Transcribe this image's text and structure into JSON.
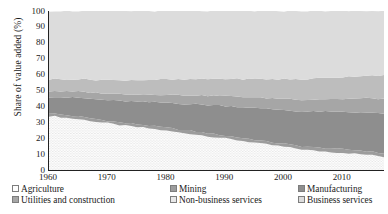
{
  "chart_data": {
    "type": "area",
    "title": "",
    "xlabel": "",
    "ylabel": "Share of value added (%)",
    "xlim": [
      1960,
      2017
    ],
    "ylim": [
      0,
      100
    ],
    "grid": false,
    "stacked": true,
    "legend_position": "bottom",
    "y_ticks": [
      0,
      10,
      20,
      30,
      40,
      50,
      60,
      70,
      80,
      90,
      100
    ],
    "x_ticks": [
      1960,
      1970,
      1980,
      1990,
      2000,
      2010
    ],
    "x": [
      1960,
      1961,
      1962,
      1963,
      1964,
      1965,
      1966,
      1967,
      1968,
      1969,
      1970,
      1971,
      1972,
      1973,
      1974,
      1975,
      1976,
      1977,
      1978,
      1979,
      1980,
      1981,
      1982,
      1983,
      1984,
      1985,
      1986,
      1987,
      1988,
      1989,
      1990,
      1991,
      1992,
      1993,
      1994,
      1995,
      1996,
      1997,
      1998,
      1999,
      2000,
      2001,
      2002,
      2003,
      2004,
      2005,
      2006,
      2007,
      2008,
      2009,
      2010,
      2011,
      2012,
      2013,
      2014,
      2015,
      2016,
      2017
    ],
    "series": [
      {
        "name": "Agriculture",
        "fill": "#fdfdfd",
        "pattern": "dots",
        "pattern_color": "#8a8a8a",
        "values": [
          34.0,
          33.7,
          33.3,
          32.8,
          32.4,
          32.0,
          31.5,
          31.0,
          30.4,
          29.9,
          29.4,
          28.8,
          28.3,
          27.8,
          27.4,
          27.0,
          26.6,
          26.1,
          25.6,
          25.1,
          24.6,
          24.1,
          23.6,
          23.2,
          22.8,
          22.3,
          21.8,
          21.3,
          20.8,
          20.3,
          19.8,
          19.3,
          18.8,
          18.3,
          17.8,
          17.2,
          16.6,
          16.1,
          15.6,
          15.1,
          14.6,
          14.0,
          13.5,
          13.0,
          12.6,
          12.2,
          11.9,
          11.6,
          11.3,
          11.1,
          10.8,
          10.5,
          10.2,
          9.9,
          9.6,
          9.2,
          8.8,
          8.3
        ]
      },
      {
        "name": "Mining",
        "fill": "#9c9c9c",
        "pattern": "solid",
        "values": [
          1.6,
          1.6,
          1.6,
          1.6,
          1.6,
          1.6,
          1.6,
          1.6,
          1.6,
          1.6,
          1.6,
          1.6,
          1.6,
          1.7,
          1.8,
          1.8,
          1.8,
          1.8,
          1.8,
          1.9,
          2.0,
          2.0,
          2.0,
          1.9,
          1.9,
          1.9,
          1.8,
          1.8,
          1.8,
          1.8,
          1.8,
          1.8,
          1.8,
          1.8,
          1.8,
          1.8,
          1.8,
          1.8,
          1.8,
          1.8,
          1.9,
          1.9,
          1.9,
          1.9,
          2.0,
          2.0,
          2.1,
          2.1,
          2.2,
          2.1,
          2.2,
          2.3,
          2.3,
          2.3,
          2.3,
          2.2,
          2.1,
          2.1
        ]
      },
      {
        "name": "Manufacturing",
        "fill": "#8e8e8e",
        "pattern": "solid",
        "values": [
          10.5,
          10.8,
          11.0,
          11.2,
          11.5,
          11.8,
          12.0,
          12.2,
          12.5,
          12.7,
          13.0,
          13.2,
          13.5,
          13.8,
          14.0,
          14.2,
          14.5,
          14.8,
          15.2,
          15.5,
          15.8,
          16.0,
          16.2,
          16.5,
          16.8,
          17.2,
          17.5,
          17.8,
          18.2,
          18.5,
          18.8,
          19.0,
          19.3,
          19.5,
          19.8,
          20.0,
          20.3,
          20.6,
          20.8,
          21.0,
          21.3,
          21.5,
          21.8,
          22.0,
          22.2,
          22.5,
          22.8,
          23.0,
          23.2,
          23.3,
          23.5,
          23.6,
          23.8,
          24.0,
          24.2,
          24.4,
          24.6,
          24.8
        ]
      },
      {
        "name": "Utilities and construction",
        "fill": "#a6a6a6",
        "pattern": "solid",
        "values": [
          3.5,
          3.6,
          3.6,
          3.7,
          3.8,
          3.9,
          4.0,
          4.0,
          4.1,
          4.2,
          4.3,
          4.3,
          4.4,
          4.5,
          4.6,
          4.6,
          4.7,
          4.8,
          4.9,
          5.0,
          5.1,
          5.2,
          5.3,
          5.4,
          5.5,
          5.6,
          5.7,
          5.8,
          5.9,
          6.0,
          6.1,
          6.2,
          6.3,
          6.4,
          6.5,
          6.6,
          6.7,
          6.8,
          6.9,
          7.0,
          7.1,
          7.2,
          7.3,
          7.4,
          7.5,
          7.6,
          7.8,
          7.9,
          8.0,
          8.1,
          8.2,
          8.4,
          8.6,
          8.8,
          9.0,
          9.2,
          9.4,
          9.6
        ]
      },
      {
        "name": "Non-business services",
        "fill": "#bdbdbd",
        "pattern": "solid",
        "values": [
          7.4,
          7.5,
          7.6,
          7.7,
          7.8,
          7.9,
          8.0,
          8.1,
          8.2,
          8.3,
          8.4,
          8.5,
          8.6,
          8.7,
          8.8,
          9.0,
          9.1,
          9.2,
          9.3,
          9.4,
          9.5,
          9.6,
          9.8,
          9.9,
          10.0,
          10.2,
          10.3,
          10.4,
          10.6,
          10.7,
          10.8,
          11.0,
          11.1,
          11.2,
          11.4,
          11.5,
          11.7,
          11.8,
          12.0,
          12.1,
          12.3,
          12.4,
          12.6,
          12.7,
          12.9,
          13.0,
          13.2,
          13.3,
          13.5,
          13.6,
          13.8,
          13.9,
          14.1,
          14.2,
          14.4,
          14.5,
          14.7,
          14.8
        ]
      },
      {
        "name": "Business services",
        "fill": "#dcdcdc",
        "pattern": "solid",
        "values": [
          43.0,
          42.8,
          42.9,
          43.0,
          42.9,
          42.8,
          42.9,
          43.1,
          43.2,
          43.3,
          43.3,
          43.6,
          43.6,
          43.5,
          43.4,
          43.4,
          43.3,
          43.3,
          43.2,
          43.1,
          43.0,
          43.1,
          43.1,
          43.1,
          43.0,
          42.8,
          42.9,
          42.9,
          42.7,
          42.7,
          42.7,
          42.7,
          42.7,
          42.8,
          42.7,
          42.9,
          42.9,
          42.9,
          42.9,
          43.0,
          42.8,
          43.0,
          42.9,
          43.0,
          42.8,
          42.7,
          42.2,
          42.1,
          41.8,
          41.8,
          41.5,
          41.3,
          41.0,
          40.8,
          40.5,
          40.5,
          40.4,
          40.4
        ]
      }
    ]
  },
  "axes": {
    "ylabel": "Share of value added (%)",
    "y_tick_labels": [
      "100",
      "90",
      "80",
      "70",
      "60",
      "50",
      "40",
      "30",
      "20",
      "10",
      "0"
    ],
    "x_tick_labels": [
      "1960",
      "1970",
      "1980",
      "1990",
      "2000",
      "2010"
    ]
  },
  "legend": {
    "row1": [
      {
        "label": "Agriculture",
        "swatch": "#fdfdfd",
        "pattern": "dots"
      },
      {
        "label": "Mining",
        "swatch": "#9c9c9c",
        "pattern": "solid"
      },
      {
        "label": "Manufacturing",
        "swatch": "#8e8e8e",
        "pattern": "solid"
      }
    ],
    "row2": [
      {
        "label": "Utilities and construction",
        "swatch": "#a6a6a6",
        "pattern": "solid"
      },
      {
        "label": "Non-business services",
        "swatch": "#e8e8e8",
        "pattern": "solid"
      },
      {
        "label": "Business services",
        "swatch": "#dcdcdc",
        "pattern": "solid"
      }
    ]
  }
}
